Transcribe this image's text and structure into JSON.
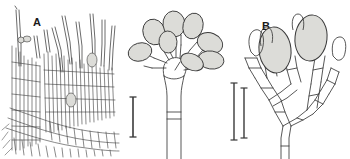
{
  "figure": {
    "kind": "scientific-line-drawing",
    "background_color": "#ffffff",
    "ink_color": "#3a3a3a",
    "conidium_fill": "#dcdcd8",
    "panel_count": 3
  },
  "panels": [
    {
      "id": "a",
      "label": "A",
      "caption_label": "A",
      "description": "dense palisade of elongated cells with projecting setae",
      "has_scale_bar": true
    },
    {
      "id": "b",
      "label": "B",
      "caption_label": "B",
      "description": "conidiophore with flared apex bearing ellipsoidal conidia",
      "has_scale_bar": true
    },
    {
      "id": "c",
      "label": "C",
      "caption_label": "C",
      "description": "branched conidiogenous cells with two large conidia",
      "has_scale_bar": true
    }
  ],
  "scale_bars": [
    {
      "for_panel": "A",
      "x": 133,
      "y_top": 97,
      "y_bottom": 137,
      "color": "#3a3a3a"
    },
    {
      "for_panel": "B",
      "x": 234,
      "y_top": 83,
      "y_bottom": 140,
      "color": "#3a3a3a"
    },
    {
      "for_panel": "C",
      "x": 244,
      "y_top": 88,
      "y_bottom": 138,
      "color": "#3a3a3a"
    }
  ]
}
